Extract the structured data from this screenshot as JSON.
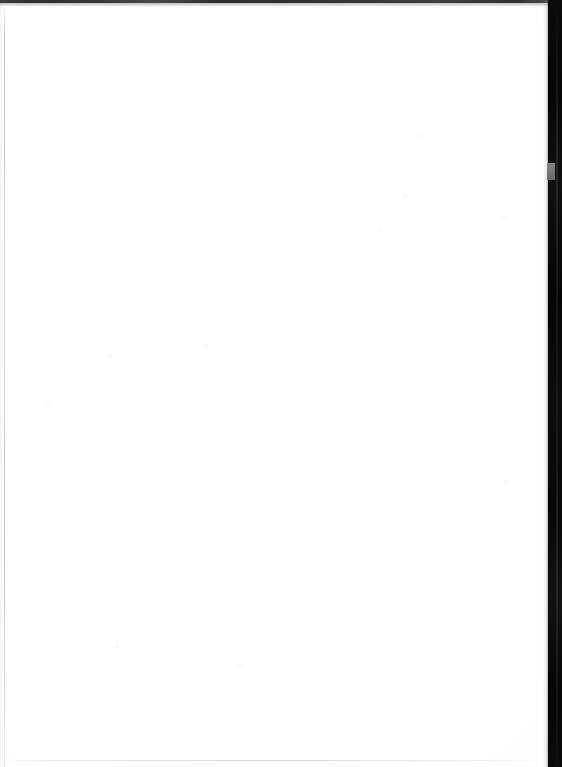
{
  "page": {
    "content_text": "",
    "background_color": "#ffffff",
    "paper_color": "#fefefe",
    "width_px": 562,
    "height_px": 767
  },
  "edges": {
    "top_strip": {
      "name": "top-edge-strip",
      "color": "#222222"
    },
    "left_margin_rule": {
      "name": "left-margin-rule",
      "color": "#b4b4b4"
    },
    "bottom_rule": {
      "name": "bottom-edge-rule",
      "color": "#d8d8d8"
    },
    "right_band": {
      "name": "scanner-edge-band",
      "color": "#0a0a0a"
    },
    "gray_notch": {
      "name": "band-gray-notch",
      "color": "#7d7d7d"
    }
  },
  "specks": [
    {
      "x": 47,
      "y": 404,
      "size": 2
    },
    {
      "x": 110,
      "y": 355,
      "size": 2
    },
    {
      "x": 205,
      "y": 344,
      "size": 2
    },
    {
      "x": 239,
      "y": 664,
      "size": 2
    },
    {
      "x": 116,
      "y": 646,
      "size": 2
    },
    {
      "x": 418,
      "y": 135,
      "size": 2
    },
    {
      "x": 404,
      "y": 195,
      "size": 2
    },
    {
      "x": 503,
      "y": 216,
      "size": 2
    },
    {
      "x": 505,
      "y": 480,
      "size": 2
    },
    {
      "x": 380,
      "y": 229,
      "size": 2
    }
  ],
  "accessibility": {
    "caption": "Blank white scanned page with dark scanner edge on the right side"
  }
}
